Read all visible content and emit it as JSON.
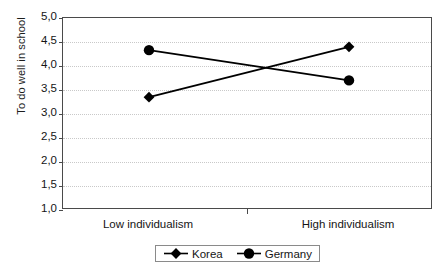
{
  "chart_data": {
    "type": "line",
    "title": "",
    "xlabel": "",
    "ylabel": "To do well in school",
    "categories": [
      "Low individualism",
      "High individualism"
    ],
    "series": [
      {
        "name": "Korea",
        "values": [
          3.35,
          4.4
        ],
        "marker": "diamond",
        "color": "#000000"
      },
      {
        "name": "Germany",
        "values": [
          4.33,
          3.7
        ],
        "marker": "circle",
        "color": "#000000"
      }
    ],
    "ylim": [
      1.0,
      5.0
    ],
    "ytick_step": 0.5,
    "ytick_labels": [
      "5,0",
      "4,5",
      "4,0",
      "3,5",
      "3,0",
      "2,5",
      "2,0",
      "1,5",
      "1,0"
    ],
    "ytick_values": [
      5.0,
      4.5,
      4.0,
      3.5,
      3.0,
      2.5,
      2.0,
      1.5,
      1.0
    ],
    "decimal_separator": ",",
    "grid": true,
    "grid_style": "dotted",
    "grid_color": "#c9c9c9",
    "legend_position": "bottom",
    "plot_border_color": "#4a4a4a",
    "background_color": "#ffffff"
  },
  "legend": {
    "entries": [
      {
        "label": "Korea",
        "marker": "diamond"
      },
      {
        "label": "Germany",
        "marker": "circle"
      }
    ]
  }
}
